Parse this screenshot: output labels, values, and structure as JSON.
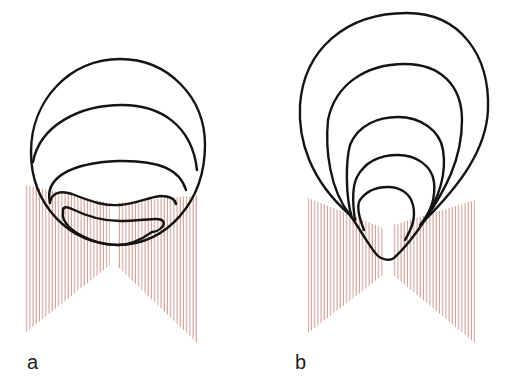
{
  "figure": {
    "panels": [
      {
        "id": "a",
        "label": "a",
        "contour_count": 5,
        "description": "Circular outer contour with nested flattened contours descending into the base between two hatched wedges"
      },
      {
        "id": "b",
        "label": "b",
        "contour_count": 5,
        "description": "Teardrop-shaped nested contours converging to a point between two hatched wedges"
      }
    ],
    "colors": {
      "background": "#ffffff",
      "contour_stroke": "#141414",
      "hatch_stroke": "#c98a80",
      "label_text": "#222222"
    }
  }
}
